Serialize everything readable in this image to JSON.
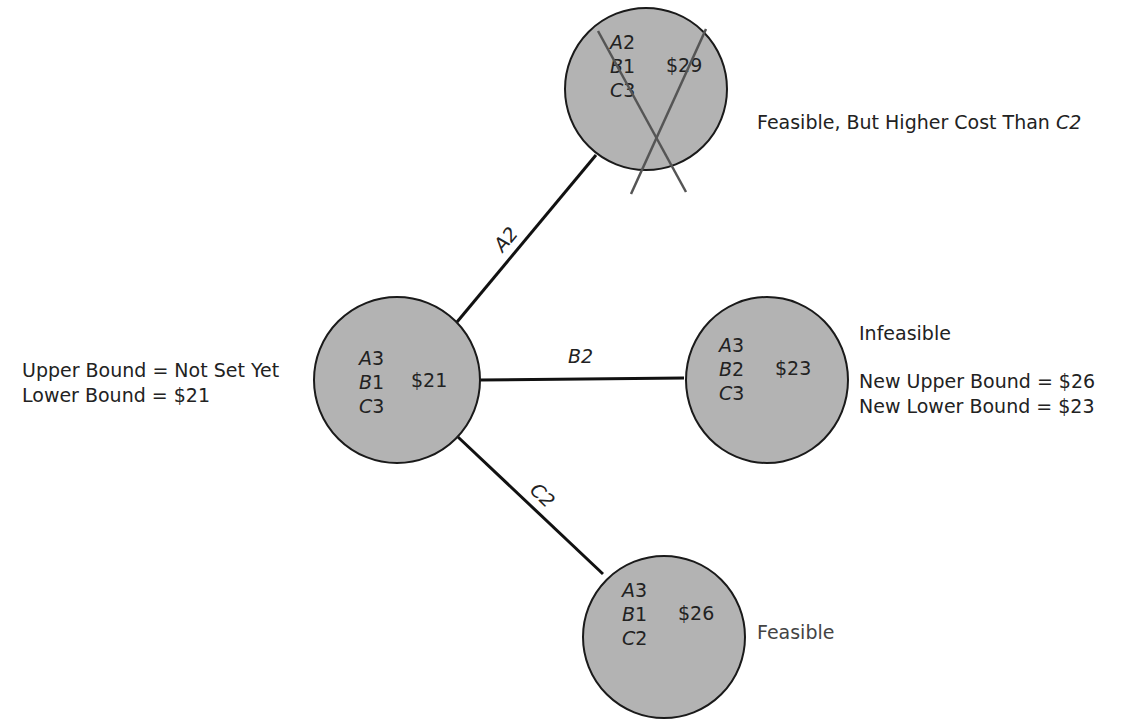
{
  "nodes": {
    "root": {
      "a": "A",
      "a_val": "3",
      "b": "B",
      "b_val": "1",
      "c": "C",
      "c_val": "3",
      "cost": "$21"
    },
    "a2": {
      "a": "A",
      "a_val": "2",
      "b": "B",
      "b_val": "1",
      "c": "C",
      "c_val": "3",
      "cost": "$29"
    },
    "b2": {
      "a": "A",
      "a_val": "3",
      "b": "B",
      "b_val": "2",
      "c": "C",
      "c_val": "3",
      "cost": "$23"
    },
    "c2": {
      "a": "A",
      "a_val": "3",
      "b": "B",
      "b_val": "1",
      "c": "C",
      "c_val": "2",
      "cost": "$26"
    }
  },
  "edges": {
    "a2_label": "A2",
    "b2_label": "B2",
    "c2_label": "C2"
  },
  "annotations": {
    "root_upper": "Upper Bound = Not Set Yet",
    "root_lower": "Lower Bound = $21",
    "a2_note_prefix": "Feasible, But Higher Cost Than ",
    "a2_note_ref": "C2",
    "b2_status": "Infeasible",
    "b2_upper": "New Upper Bound = $26",
    "b2_lower": "New Lower Bound = $23",
    "c2_status": "Feasible"
  },
  "colors": {
    "node_fill": "#b3b3b3",
    "line": "#111111",
    "cross": "#555555"
  }
}
